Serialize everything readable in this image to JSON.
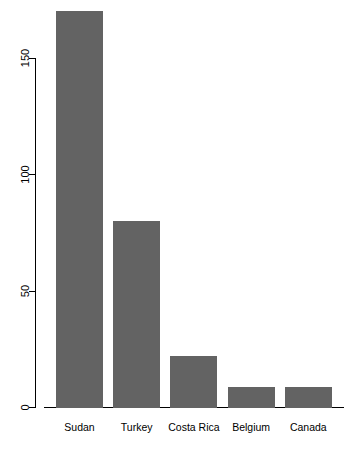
{
  "chart_data": {
    "type": "bar",
    "title": "",
    "subtitle": "",
    "xlabel": "",
    "ylabel": "",
    "categories": [
      "Sudan",
      "Turkey",
      "Costa Rica",
      "Belgium",
      "Canada"
    ],
    "values": [
      170,
      80,
      22,
      9,
      9
    ],
    "series": [
      {
        "name": "count",
        "values": [
          170,
          80,
          22,
          9,
          9
        ]
      }
    ],
    "ylim": [
      0,
      175
    ],
    "y_ticks": [
      0,
      50,
      100,
      150
    ],
    "y_tick_labels": [
      "0",
      "50",
      "100",
      "150"
    ],
    "grid": false,
    "legend": null,
    "legend_position": "none",
    "bar_color": "#636363",
    "axis_color": "#000000",
    "background_color": "#ffffff",
    "y_tick_label_rotation": 90,
    "annotations": []
  },
  "axis": {
    "y_axis_name": "y-axis",
    "x_axis_name": "x-axis"
  }
}
